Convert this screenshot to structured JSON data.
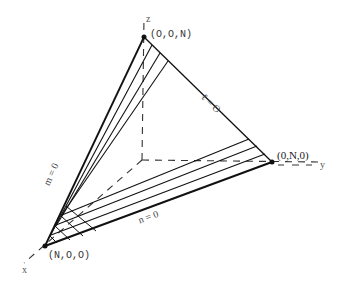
{
  "diagram": {
    "axes": {
      "x": {
        "label": "x"
      },
      "y": {
        "label": "y"
      },
      "z": {
        "label": "z"
      }
    },
    "vertices": {
      "top": {
        "label": "(O,O,N)"
      },
      "right": {
        "label": "(0,N,0)"
      },
      "bottom_left": {
        "label": "(N,O,O)"
      }
    },
    "edges": {
      "right_edge": {
        "label": "ℓ = O"
      },
      "left_edge": {
        "label": "m = 0"
      },
      "bottom_edge": {
        "label": "n = 0"
      }
    },
    "colors": {
      "line": "#111111",
      "dash": "#333333",
      "background": "#ffffff"
    }
  }
}
